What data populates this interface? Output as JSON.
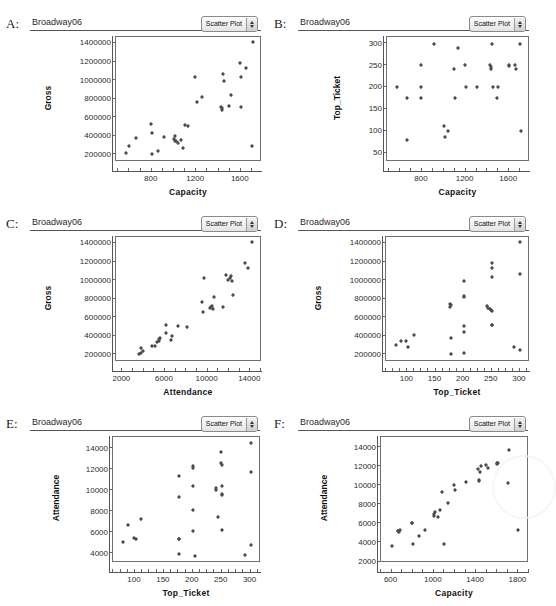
{
  "figure": {
    "panel_count": 6,
    "dataset_title": "Broadway06",
    "select_label": "Scatter Plot",
    "select_icon": "stepper-updown-icon"
  },
  "panels": [
    {
      "letter": "A:",
      "xlabel": "Capacity",
      "ylabel": "Gross"
    },
    {
      "letter": "B:",
      "xlabel": "Capacity",
      "ylabel": "Top_Ticket"
    },
    {
      "letter": "C:",
      "xlabel": "Attendance",
      "ylabel": "Gross"
    },
    {
      "letter": "D:",
      "xlabel": "Top_Ticket",
      "ylabel": "Gross"
    },
    {
      "letter": "E:",
      "xlabel": "Top_Ticket",
      "ylabel": "Attendance"
    },
    {
      "letter": "F:",
      "xlabel": "Capacity",
      "ylabel": "Attendance"
    }
  ],
  "chart_data": [
    {
      "id": "A",
      "type": "scatter",
      "title": "Broadway06",
      "xlabel": "Capacity",
      "ylabel": "Gross",
      "xlim": [
        480,
        1790
      ],
      "ylim": [
        120000,
        1470000
      ],
      "xticks": [
        400,
        800,
        1200,
        1600
      ],
      "yticks": [
        200000,
        400000,
        600000,
        800000,
        1000000,
        1200000,
        1400000
      ],
      "grid": false,
      "legend": "none",
      "x": [
        570,
        600,
        660,
        795,
        800,
        800,
        860,
        915,
        1000,
        1010,
        1010,
        1020,
        1040,
        1060,
        1080,
        1100,
        1130,
        1190,
        1205,
        1255,
        1420,
        1430,
        1430,
        1440,
        1450,
        1490,
        1510,
        1595,
        1600,
        1600,
        1650,
        1700,
        1710
      ],
      "y": [
        215000,
        298000,
        380000,
        528000,
        205000,
        437000,
        240000,
        392000,
        373000,
        352000,
        398000,
        345000,
        330000,
        362000,
        270000,
        520000,
        505000,
        1035000,
        770000,
        820000,
        710000,
        680000,
        700000,
        1075000,
        995000,
        725000,
        840000,
        1190000,
        1040000,
        715000,
        1130000,
        290000,
        1415000
      ]
    },
    {
      "id": "B",
      "type": "scatter",
      "title": "Broadway06",
      "xlabel": "Capacity",
      "ylabel": "Top_Ticket",
      "xlim": [
        480,
        1790
      ],
      "ylim": [
        30,
        315
      ],
      "xticks": [
        400,
        800,
        1200,
        1600
      ],
      "yticks": [
        50,
        100,
        150,
        200,
        250,
        300
      ],
      "grid": false,
      "legend": "none",
      "x": [
        570,
        660,
        660,
        790,
        790,
        795,
        915,
        1000,
        1010,
        1040,
        1090,
        1100,
        1130,
        1190,
        1200,
        1300,
        1420,
        1430,
        1430,
        1440,
        1450,
        1490,
        1500,
        1595,
        1600,
        1650,
        1660,
        1700,
        1710
      ],
      "y": [
        201,
        176,
        80,
        251,
        201,
        177,
        300,
        111,
        88,
        101,
        241,
        177,
        290,
        251,
        201,
        201,
        251,
        243,
        247,
        300,
        201,
        176,
        201,
        251,
        248,
        251,
        241,
        300,
        101
      ]
    },
    {
      "id": "C",
      "type": "scatter",
      "title": "Broadway06",
      "xlabel": "Attendance",
      "ylabel": "Gross",
      "xlim": [
        1400,
        15100
      ],
      "ylim": [
        120000,
        1470000
      ],
      "xticks": [
        2000,
        6000,
        10000,
        14000
      ],
      "yticks": [
        200000,
        400000,
        600000,
        800000,
        1000000,
        1200000,
        1400000
      ],
      "grid": false,
      "legend": "none",
      "x": [
        3600,
        3700,
        3750,
        3900,
        4750,
        5050,
        5250,
        5400,
        5450,
        5500,
        6050,
        6100,
        6550,
        6700,
        7200,
        8100,
        9500,
        9550,
        9650,
        10200,
        10350,
        10450,
        10500,
        10600,
        11400,
        11700,
        11900,
        12100,
        12200,
        12250,
        12400,
        13500,
        13750,
        14200
      ],
      "y": [
        205000,
        212000,
        270000,
        240000,
        290000,
        292000,
        340000,
        352000,
        368000,
        377000,
        438000,
        522000,
        360000,
        405000,
        505000,
        500000,
        770000,
        665000,
        1030000,
        700000,
        712000,
        730000,
        690000,
        820000,
        718000,
        1065000,
        1010000,
        1030000,
        1045000,
        1000000,
        840000,
        1190000,
        1130000,
        1415000
      ]
    },
    {
      "id": "D",
      "type": "scatter",
      "title": "Broadway06",
      "xlabel": "Top_Ticket",
      "ylabel": "Gross",
      "xlim": [
        62,
        318
      ],
      "ylim": [
        120000,
        1470000
      ],
      "xticks": [
        50,
        100,
        150,
        200,
        250,
        300
      ],
      "yticks": [
        200000,
        400000,
        600000,
        800000,
        1000000,
        1200000,
        1400000
      ],
      "grid": false,
      "legend": "none",
      "x": [
        80,
        88,
        98,
        101,
        111,
        176,
        176,
        177,
        177,
        177,
        201,
        201,
        201,
        201,
        201,
        201,
        241,
        243,
        247,
        248,
        251,
        251,
        251,
        251,
        251,
        251,
        290,
        300,
        300,
        300
      ],
      "y": [
        300000,
        352000,
        352000,
        285000,
        412000,
        750000,
        718000,
        378000,
        205000,
        735000,
        830000,
        820000,
        990000,
        505000,
        440000,
        212000,
        722000,
        700000,
        690000,
        680000,
        1190000,
        1130000,
        1040000,
        520000,
        518000,
        675000,
        285000,
        1415000,
        1070000,
        245000
      ]
    },
    {
      "id": "E",
      "type": "scatter",
      "title": "Broadway06",
      "xlabel": "Top_Ticket",
      "ylabel": "Attendance",
      "xlim": [
        62,
        318
      ],
      "ylim": [
        3100,
        15100
      ],
      "xticks": [
        50,
        100,
        150,
        200,
        250,
        300
      ],
      "yticks": [
        4000,
        6000,
        8000,
        10000,
        12000,
        14000
      ],
      "grid": false,
      "legend": "none",
      "x": [
        80,
        88,
        98,
        101,
        111,
        176,
        176,
        176,
        177,
        177,
        201,
        201,
        201,
        201,
        201,
        203,
        241,
        241,
        243,
        248,
        248,
        250,
        250,
        251,
        251,
        251,
        290,
        300,
        300,
        300
      ],
      "y": [
        5100,
        6700,
        5450,
        5420,
        7250,
        11400,
        9350,
        5400,
        3950,
        5400,
        12300,
        12150,
        10400,
        8150,
        6150,
        3750,
        10250,
        10100,
        7500,
        13700,
        12600,
        12400,
        9700,
        10400,
        9550,
        6250,
        3900,
        14500,
        11750,
        4850
      ]
    },
    {
      "id": "F",
      "type": "scatter",
      "title": "Broadway06",
      "xlabel": "Capacity",
      "ylabel": "Attendance",
      "xlim": [
        500,
        1900
      ],
      "ylim": [
        1900,
        15100
      ],
      "xticks": [
        600,
        1000,
        1400,
        1800
      ],
      "yticks": [
        2000,
        4000,
        6000,
        8000,
        10000,
        12000,
        14000
      ],
      "grid": false,
      "legend": "none",
      "x": [
        600,
        660,
        665,
        670,
        680,
        790,
        795,
        800,
        860,
        915,
        1000,
        1005,
        1010,
        1040,
        1060,
        1080,
        1100,
        1130,
        1190,
        1200,
        1300,
        1420,
        1430,
        1430,
        1440,
        1450,
        1490,
        1510,
        1595,
        1600,
        1605,
        1700,
        1710,
        1800
      ],
      "y": [
        3650,
        5250,
        5300,
        5200,
        5350,
        6050,
        6100,
        3900,
        4750,
        5400,
        6800,
        7000,
        7200,
        6750,
        7450,
        9350,
        3850,
        8150,
        10100,
        9500,
        10400,
        11700,
        10500,
        10600,
        11400,
        12100,
        12200,
        11850,
        12400,
        12250,
        12350,
        10250,
        13700,
        5400
      ],
      "f_extra": true
    }
  ]
}
